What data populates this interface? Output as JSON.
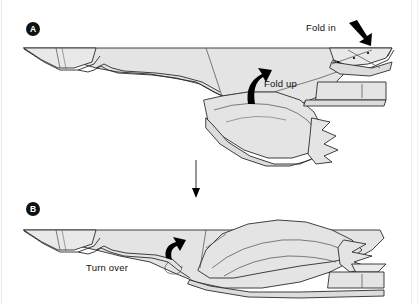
{
  "figure": {
    "kind": "origami-fold-instruction-diagram",
    "background_color": "#ffffff",
    "paper_fill": "#e4e4e4",
    "ink_color": "#2b2b2b"
  },
  "panels": [
    {
      "id": "A",
      "badge_label": "A",
      "annotations": [
        {
          "name": "fold-in",
          "label": "Fold in",
          "arrow": "bold-arrow-down-right"
        },
        {
          "name": "fold-up",
          "label": "Fold up",
          "arrow": "bold-curved-arrow-up"
        }
      ]
    },
    {
      "id": "B",
      "badge_label": "B",
      "annotations": [
        {
          "name": "turn-over",
          "label": "Turn over",
          "arrow": "bold-curved-arrow-turn"
        }
      ]
    }
  ],
  "connector": {
    "name": "step-arrow",
    "direction": "down",
    "label": ""
  }
}
